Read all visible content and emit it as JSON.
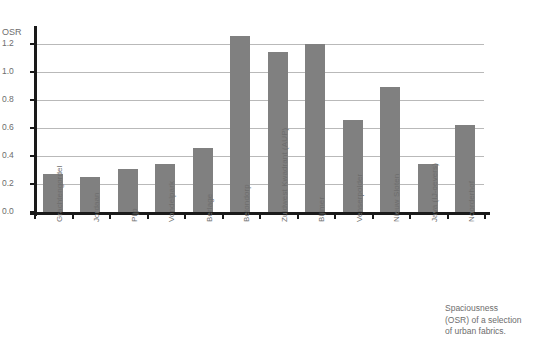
{
  "chart_data": {
    "type": "bar",
    "title": "",
    "xlabel": "",
    "ylabel": "OSR",
    "ylim": [
      0.0,
      1.3
    ],
    "grid": true,
    "legend": "none",
    "bar_color": "#808080",
    "axis_color": "#1a1a1a",
    "gridline_color": "#b9b9b9",
    "ytick_labels": [
      "0.0",
      "0.2",
      "0.4",
      "0.6",
      "0.8",
      "1.0",
      "1.2"
    ],
    "ytick_values": [
      0.0,
      0.2,
      0.4,
      0.6,
      0.8,
      1.0,
      1.2
    ],
    "categories": [
      "Grachtengordel",
      "Jordaan",
      "Pijp",
      "Vondelpark",
      "Berlage",
      "Betondorp",
      "Zuidwest Kwadrant (AUP)",
      "Bijlmer",
      "Venserpolder",
      "Nieuw Sloten",
      "Java (IJ-oevers)",
      "Noorderhof"
    ],
    "values": [
      0.27,
      0.25,
      0.31,
      0.34,
      0.46,
      1.26,
      1.14,
      1.2,
      0.66,
      0.89,
      0.34,
      0.62
    ]
  },
  "caption": {
    "line1": "Spaciousness",
    "line2": "(OSR) of a selection",
    "line3": "of urban fabrics."
  }
}
